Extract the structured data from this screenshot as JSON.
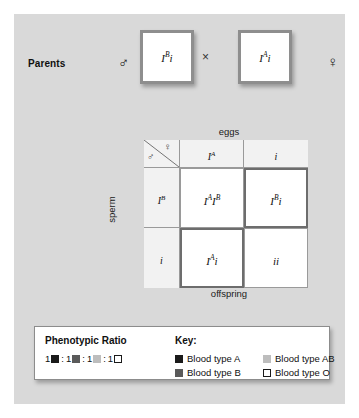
{
  "figure": {
    "parents": {
      "label": "Parents",
      "male_symbol": "♂",
      "female_symbol": "♀",
      "cross_symbol": "×",
      "male_genotype": {
        "allele1": "I",
        "sup1": "B",
        "allele2": "i"
      },
      "female_genotype": {
        "allele1": "I",
        "sup1": "A",
        "allele2": "i"
      }
    },
    "punnett": {
      "top_label": "eggs",
      "bottom_label": "offspring",
      "side_label": "sperm",
      "corner_female_symbol": "♀",
      "corner_male_symbol": "♂",
      "egg_headers": [
        {
          "allele": "I",
          "sup": "A"
        },
        {
          "allele": "i",
          "sup": ""
        }
      ],
      "sperm_headers": [
        {
          "allele": "I",
          "sup": "B"
        },
        {
          "allele": "i",
          "sup": ""
        }
      ],
      "cells": [
        {
          "text_a": "I",
          "sup_a": "A",
          "text_b": "I",
          "sup_b": "B",
          "highlight": false,
          "blood_type": "AB"
        },
        {
          "text_a": "I",
          "sup_a": "B",
          "text_b": "i",
          "sup_b": "",
          "highlight": true,
          "blood_type": "B"
        },
        {
          "text_a": "I",
          "sup_a": "A",
          "text_b": "i",
          "sup_b": "",
          "highlight": true,
          "blood_type": "A"
        },
        {
          "text_a": "i",
          "sup_a": "",
          "text_b": "i",
          "sup_b": "",
          "highlight": false,
          "blood_type": "O"
        }
      ]
    },
    "legend": {
      "ratio_title": "Phenotypic Ratio",
      "key_title": "Key:",
      "ratio_counts": [
        "1",
        "1",
        "1",
        "1"
      ],
      "ratio_separator": ":",
      "ratio_swatch_colors": [
        "#1a1a1a",
        "#5a5a5a",
        "#bdbdbd",
        "#ffffff"
      ],
      "key_items": [
        {
          "label": "Blood type A",
          "color": "#1a1a1a"
        },
        {
          "label": "Blood type AB",
          "color": "#bdbdbd"
        },
        {
          "label": "Blood type B",
          "color": "#5a5a5a"
        },
        {
          "label": "Blood type O",
          "color": "#ffffff"
        }
      ]
    }
  },
  "colors": {
    "panel_background": "#d9d9d9",
    "cell_background": "#ffffff",
    "header_background": "#f2f2f2",
    "grid_line": "#9a9a9a",
    "highlight_border": "#6d6d6d",
    "parent_box_border": "#8e8e8e"
  }
}
